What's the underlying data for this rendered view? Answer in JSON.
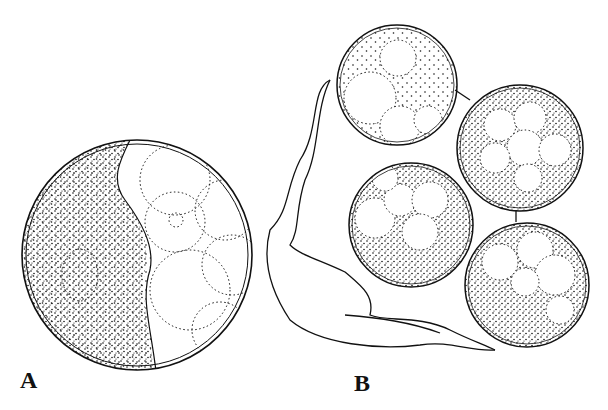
{
  "figure": {
    "panels": [
      {
        "label": "A",
        "description": "single large stippled cyst with vacuolated cytoplasm and inner nucleus"
      },
      {
        "label": "B",
        "description": "cluster of four stippled cysts attached to a membranous sac"
      }
    ]
  },
  "colors": {
    "ink": "#111111",
    "background": "#ffffff"
  }
}
